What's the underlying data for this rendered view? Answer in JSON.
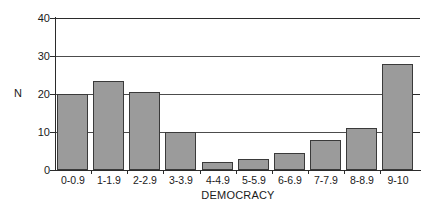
{
  "chart_data": {
    "type": "bar",
    "title": "",
    "xlabel": "DEMOCRACY",
    "ylabel": "N",
    "categories": [
      "0-0.9",
      "1-1.9",
      "2-2.9",
      "3-3.9",
      "4-4.9",
      "5-5.9",
      "6-6.9",
      "7-7.9",
      "8-8.9",
      "9-10"
    ],
    "values": [
      20,
      23.5,
      20.5,
      10,
      2,
      3,
      4.5,
      8,
      11,
      28
    ],
    "ylim": [
      0,
      40
    ],
    "yticks": [
      0,
      10,
      20,
      30,
      40
    ],
    "ytick_labels": [
      "0",
      "10",
      "20",
      "30",
      "40"
    ],
    "grid": true,
    "grid_axis": "y",
    "legend": "none",
    "bar_color": "#9b9b9b",
    "bar_edge_color": "#3a3a3a",
    "axis_color": "#2b2b2b",
    "background": "#ffffff"
  },
  "axes": {
    "y_title": "N",
    "x_title": "DEMOCRACY"
  }
}
